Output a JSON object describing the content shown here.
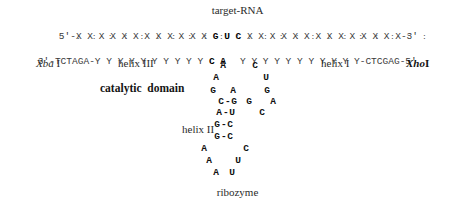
{
  "figure": {
    "title": "target-RNA",
    "caption": "ribozyme"
  },
  "target_strand": {
    "five_prime": "5'-",
    "left_unpaired": "X X X X X X X X X X X X ",
    "cleavage_triplet": "G U C",
    "right_unpaired": " X X X X X X X X X X X X X X",
    "three_prime": "-3'"
  },
  "pairing": {
    "left_dots": ":  :  :  :  :  :  :  :  :  :  :  :",
    "right_dots": ":  :  :  :  :  :  :  :  :  :  :  :"
  },
  "ribozyme_strand": {
    "three_prime": "3'-",
    "xba_site": "TCTAGA",
    "left_link": "-",
    "left_arm": "Y Y Y Y Y Y Y Y Y Y ",
    "core_left": "C A",
    "right_arm": "Y Y Y Y Y Y Y Y Y Y Y",
    "right_link": "-",
    "xho_site": "CTCGAG",
    "five_prime": "-5'"
  },
  "labels": {
    "xba": "Xba",
    "xba_num": " I",
    "helix3": "helix III",
    "catalytic": "catalytic  domain",
    "helix1": "helix I",
    "xho": "Xho",
    "xho_num": "I",
    "helix2": "helix II"
  },
  "stem_loop": {
    "row_a": {
      "left": "A",
      "right": "C"
    },
    "row_b": {
      "left": "A",
      "right": "U"
    },
    "row_c": {
      "l1": "G",
      "l2": "A",
      "r1": "G"
    },
    "row_d": {
      "l1": "C",
      "bond": "-",
      "l2": "G",
      "l3": "G",
      "r1": "A"
    },
    "row_e": {
      "l1": "A",
      "bond": "-",
      "l2": "U",
      "r1": "C"
    },
    "row_f": {
      "l1": "G",
      "bond": "-",
      "l2": "C"
    },
    "row_g": {
      "l1": "G",
      "bond": "-",
      "l2": "C"
    },
    "loop_1": {
      "left": "A",
      "right": "C"
    },
    "loop_2": {
      "left": "A",
      "right": "U"
    },
    "loop_3": {
      "left": "A",
      "right": "U"
    }
  },
  "colors": {
    "ink": "#1a1a1a",
    "muted": "#3a3a3a",
    "background": "#ffffff"
  }
}
